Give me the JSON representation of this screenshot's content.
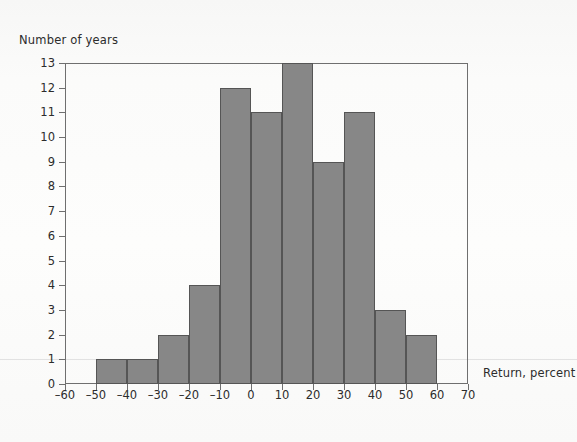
{
  "figure": {
    "ylabel": "Number of years",
    "xlabel": "Return, percent"
  },
  "chart_data": {
    "type": "bar",
    "title": "",
    "subtitle": "",
    "xlabel": "Return, percent",
    "ylabel": "Number of years",
    "xlim": [
      -60,
      70
    ],
    "ylim": [
      0,
      13
    ],
    "xtick_step": 10,
    "ytick_step": 1,
    "grid": false,
    "legend": null,
    "bin_width": 10,
    "bin_edges": [
      -50,
      -40,
      -30,
      -20,
      -10,
      0,
      10,
      20,
      30,
      40,
      50,
      60
    ],
    "categories": [
      "-50 to -40",
      "-40 to -30",
      "-30 to -20",
      "-20 to -10",
      "-10 to 0",
      "0 to 10",
      "10 to 20",
      "20 to 30",
      "30 to 40",
      "40 to 50",
      "50 to 60"
    ],
    "values": [
      1,
      1,
      2,
      4,
      12,
      11,
      13,
      9,
      11,
      3,
      2
    ],
    "xticks": [
      -60,
      -50,
      -40,
      -30,
      -20,
      -10,
      0,
      10,
      20,
      30,
      40,
      50,
      60,
      70
    ],
    "xtick_labels": [
      "–60",
      "–50",
      "–40",
      "–30",
      "–20",
      "–10",
      "0",
      "10",
      "20",
      "30",
      "40",
      "50",
      "60",
      "70"
    ],
    "yticks": [
      0,
      1,
      2,
      3,
      4,
      5,
      6,
      7,
      8,
      9,
      10,
      11,
      12,
      13
    ],
    "ytick_labels": [
      "0",
      "1",
      "2",
      "3",
      "4",
      "5",
      "6",
      "7",
      "8",
      "9",
      "10",
      "11",
      "12",
      "13"
    ],
    "colors": {
      "bar_fill": "#878787",
      "bar_edge": "#555555",
      "axis": "#6f6f6f",
      "text": "#2c2c2c",
      "background": "#fbfbfa"
    }
  }
}
